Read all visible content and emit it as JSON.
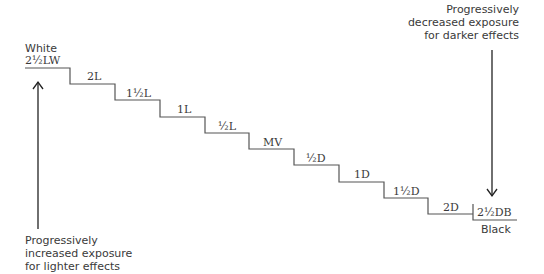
{
  "top_label": "White",
  "bottom_label": "Black",
  "steps": [
    {
      "label": "2½LW"
    },
    {
      "label": "2L"
    },
    {
      "label": "1½L"
    },
    {
      "label": "1L"
    },
    {
      "label": "½L"
    },
    {
      "label": "MV"
    },
    {
      "label": "½D"
    },
    {
      "label": "1D"
    },
    {
      "label": "1½D"
    },
    {
      "label": "2D"
    },
    {
      "label": "2½DB"
    }
  ],
  "captions": {
    "darker": [
      "Progressively",
      "decreased exposure",
      "for darker effects"
    ],
    "lighter": [
      "Progressively",
      "increased exposure",
      "for lighter effects"
    ]
  },
  "colors": {
    "line": "#555555",
    "text": "#3a3a3a",
    "arrow": "#222222"
  }
}
